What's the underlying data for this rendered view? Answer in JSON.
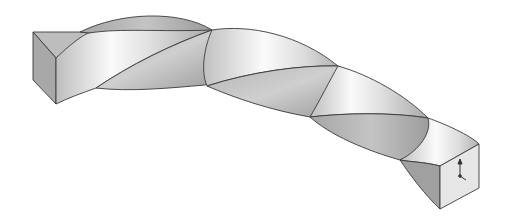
{
  "figure": {
    "view": "isometric",
    "style": "grayscale shaded render",
    "features": [
      "square end face left",
      "square end face right",
      "helical twist along curved path",
      "coordinate triad on right end face"
    ],
    "colors": {
      "background": "#ffffff",
      "edge": "#3a3a3a",
      "face_light": "#f4f4f4",
      "face_mid": "#c8c8c8",
      "face_dark": "#9a9a9a",
      "end_face": "#e6e6e6"
    }
  }
}
